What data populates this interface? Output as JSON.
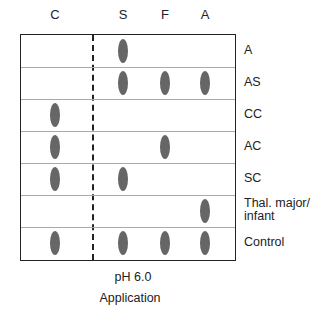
{
  "columns": [
    {
      "label": "C",
      "x": 55
    },
    {
      "label": "S",
      "x": 123
    },
    {
      "label": "F",
      "x": 165
    },
    {
      "label": "A",
      "x": 205
    }
  ],
  "rows": [
    {
      "label": "A",
      "bands": [
        "S"
      ]
    },
    {
      "label": "AS",
      "bands": [
        "S",
        "F",
        "A"
      ]
    },
    {
      "label": "CC",
      "bands": [
        "C"
      ]
    },
    {
      "label": "AC",
      "bands": [
        "C",
        "F"
      ]
    },
    {
      "label": "SC",
      "bands": [
        "C",
        "S"
      ]
    },
    {
      "label": "Thal. major/\ninfant",
      "bands": [
        "A"
      ]
    },
    {
      "label": "Control",
      "bands": [
        "C",
        "S",
        "F",
        "A"
      ]
    }
  ],
  "footer": {
    "ph": "pH 6.0",
    "application": "Application"
  },
  "colors": {
    "band": "#666666",
    "border": "#222222",
    "separator": "#aaaaaa"
  }
}
